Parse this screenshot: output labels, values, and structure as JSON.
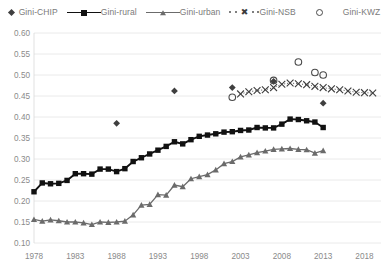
{
  "legend": {
    "items": [
      {
        "label": "Gini-CHIP",
        "marker": "diamond-marker"
      },
      {
        "label": "Gini-rural",
        "marker": "line-square-marker"
      },
      {
        "label": "Gini-urban",
        "marker": "line-triangle-marker"
      },
      {
        "label": "Gini-NSB",
        "marker": "dotted-x-marker"
      },
      {
        "label": "Gini-KWZ",
        "marker": "open-circle-marker"
      }
    ]
  },
  "chart_data": {
    "type": "line",
    "title": "",
    "xlabel": "",
    "ylabel": "",
    "xlim": [
      1978,
      2020
    ],
    "ylim": [
      0.1,
      0.6
    ],
    "ytick_labels": [
      "0.60",
      "0.55",
      "0.50",
      "0.45",
      "0.40",
      "0.35",
      "0.30",
      "0.25",
      "0.20",
      "0.15",
      "0.10"
    ],
    "yticks": [
      0.6,
      0.55,
      0.5,
      0.45,
      0.4,
      0.35,
      0.3,
      0.25,
      0.2,
      0.15,
      0.1
    ],
    "xtick_labels": [
      "1978",
      "1983",
      "1988",
      "1993",
      "1998",
      "2003",
      "2008",
      "2013",
      "2018"
    ],
    "xticks": [
      1978,
      1983,
      1988,
      1993,
      1998,
      2003,
      2008,
      2013,
      2018
    ],
    "grid": "horizontal",
    "legend_position": "top",
    "series": [
      {
        "name": "Gini-CHIP",
        "style": "markers-only",
        "marker": "filled-diamond",
        "color": "#3f3f3f",
        "points": [
          {
            "x": 1988,
            "y": 0.385
          },
          {
            "x": 1995,
            "y": 0.462
          },
          {
            "x": 2002,
            "y": 0.47
          },
          {
            "x": 2007,
            "y": 0.485
          },
          {
            "x": 2013,
            "y": 0.433
          }
        ]
      },
      {
        "name": "Gini-rural",
        "style": "line-markers",
        "marker": "filled-square",
        "color": "#111111",
        "x": [
          1978,
          1979,
          1980,
          1981,
          1982,
          1983,
          1984,
          1985,
          1986,
          1987,
          1988,
          1989,
          1990,
          1991,
          1992,
          1993,
          1994,
          1995,
          1996,
          1997,
          1998,
          1999,
          2000,
          2001,
          2002,
          2003,
          2004,
          2005,
          2006,
          2007,
          2008,
          2009,
          2010,
          2011,
          2012,
          2013
        ],
        "y": [
          0.222,
          0.243,
          0.241,
          0.242,
          0.249,
          0.265,
          0.265,
          0.264,
          0.276,
          0.276,
          0.27,
          0.277,
          0.294,
          0.303,
          0.312,
          0.321,
          0.33,
          0.341,
          0.336,
          0.346,
          0.354,
          0.357,
          0.36,
          0.364,
          0.365,
          0.368,
          0.369,
          0.375,
          0.374,
          0.374,
          0.383,
          0.395,
          0.394,
          0.391,
          0.388,
          0.375
        ]
      },
      {
        "name": "Gini-urban",
        "style": "line-markers",
        "marker": "filled-triangle",
        "color": "#6b6b6b",
        "x": [
          1978,
          1979,
          1980,
          1981,
          1982,
          1983,
          1984,
          1985,
          1986,
          1987,
          1988,
          1989,
          1990,
          1991,
          1992,
          1993,
          1994,
          1995,
          1996,
          1997,
          1998,
          1999,
          2000,
          2001,
          2002,
          2003,
          2004,
          2005,
          2006,
          2007,
          2008,
          2009,
          2010,
          2011,
          2012,
          2013
        ],
        "y": [
          0.156,
          0.152,
          0.155,
          0.153,
          0.15,
          0.15,
          0.148,
          0.144,
          0.15,
          0.149,
          0.15,
          0.152,
          0.167,
          0.19,
          0.192,
          0.215,
          0.214,
          0.238,
          0.234,
          0.253,
          0.258,
          0.263,
          0.274,
          0.289,
          0.294,
          0.305,
          0.31,
          0.315,
          0.319,
          0.323,
          0.324,
          0.325,
          0.323,
          0.322,
          0.314,
          0.32
        ]
      },
      {
        "name": "Gini-NSB",
        "style": "dotted-markers",
        "marker": "x-cross",
        "color": "#3c3c3c",
        "x": [
          2003,
          2004,
          2005,
          2006,
          2007,
          2008,
          2009,
          2010,
          2011,
          2012,
          2013,
          2014,
          2015,
          2016,
          2017,
          2018,
          2019
        ],
        "y": [
          0.455,
          0.46,
          0.463,
          0.465,
          0.47,
          0.478,
          0.481,
          0.479,
          0.477,
          0.473,
          0.47,
          0.467,
          0.465,
          0.462,
          0.459,
          0.458,
          0.457
        ]
      },
      {
        "name": "Gini-KWZ",
        "style": "markers-only",
        "marker": "open-circle",
        "color": "#4a4a4a",
        "points": [
          {
            "x": 2002,
            "y": 0.447
          },
          {
            "x": 2007,
            "y": 0.487
          },
          {
            "x": 2010,
            "y": 0.531
          },
          {
            "x": 2012,
            "y": 0.506
          },
          {
            "x": 2013,
            "y": 0.5
          }
        ]
      }
    ]
  }
}
